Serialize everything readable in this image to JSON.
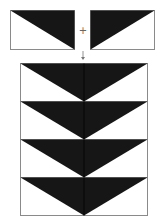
{
  "diagram": {
    "colors": {
      "dark": "#161616",
      "light": "#ffffff",
      "outline": "#8a8a8a"
    },
    "operators": {
      "plus": "+",
      "arrow": "↓"
    },
    "top_units": [
      {
        "name": "left-half-unit",
        "dark_side": "upper-right triangle"
      },
      {
        "name": "right-half-unit",
        "dark_side": "upper-left triangle"
      }
    ],
    "result": {
      "rows": 4,
      "unit": "flying-geese (downward pointing dark triangle)"
    }
  }
}
